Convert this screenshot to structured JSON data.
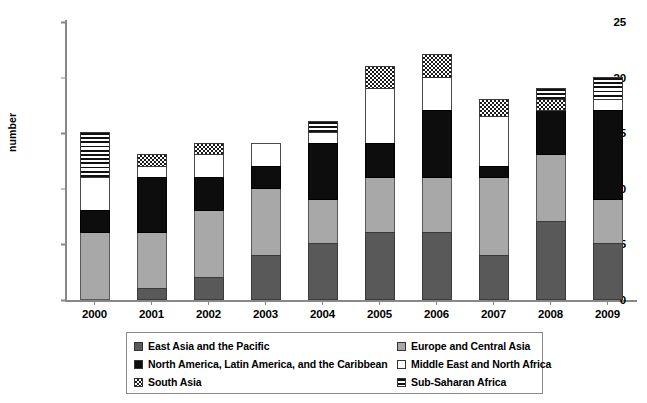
{
  "chart_data": {
    "type": "bar",
    "stacked": true,
    "title": "",
    "xlabel": "",
    "ylabel": "number",
    "ylim": [
      0,
      25
    ],
    "yticks": [
      0,
      5,
      10,
      15,
      20,
      25
    ],
    "grid": false,
    "legend_position": "bottom",
    "categories": [
      "2000",
      "2001",
      "2002",
      "2003",
      "2004",
      "2005",
      "2006",
      "2007",
      "2008",
      "2009"
    ],
    "series": [
      {
        "name": "East Asia and the Pacific",
        "swatch": "dark-gray-solid",
        "color": "#595959",
        "values": [
          0,
          1,
          2,
          4,
          5,
          6,
          6,
          4,
          7,
          5
        ]
      },
      {
        "name": "Europe and Central Asia",
        "swatch": "medium-gray-solid",
        "color": "#a8a8a8",
        "values": [
          6,
          5,
          6,
          6,
          4,
          5,
          5,
          7,
          6,
          4
        ]
      },
      {
        "name": "North America, Latin America, and the Caribbean",
        "swatch": "black-solid",
        "color": "#0d0d0d",
        "values": [
          2,
          5,
          3,
          2,
          5,
          3,
          6,
          1,
          4,
          8
        ]
      },
      {
        "name": "Middle East and North Africa",
        "swatch": "white-solid",
        "color": "#ffffff",
        "values": [
          3,
          1,
          2,
          2,
          1,
          5,
          3,
          4.5,
          0,
          1
        ]
      },
      {
        "name": "South Asia",
        "swatch": "checkerboard",
        "color": "#ffffff",
        "values": [
          0,
          1,
          1,
          0,
          0,
          2,
          2,
          1.5,
          1,
          0
        ]
      },
      {
        "name": "Sub-Saharan Africa",
        "swatch": "horizontal-stripes",
        "color": "#ffffff",
        "values": [
          4,
          0,
          0,
          0,
          1,
          0,
          0,
          0,
          1,
          2
        ]
      }
    ],
    "totals": [
      15,
      13,
      14,
      14,
      16,
      21,
      22,
      18,
      19,
      20
    ]
  },
  "axis": {
    "y_title": "number",
    "y_tick_labels": [
      "0",
      "5",
      "10",
      "15",
      "20",
      "25"
    ],
    "x_tick_labels": [
      "2000",
      "2001",
      "2002",
      "2003",
      "2004",
      "2005",
      "2006",
      "2007",
      "2008",
      "2009"
    ]
  },
  "legend": {
    "left_column": [
      {
        "label": "East Asia and the Pacific",
        "swatch": "east"
      },
      {
        "label": "North America, Latin America, and the Caribbean",
        "swatch": "northamerica"
      },
      {
        "label": "South Asia",
        "swatch": "southasia"
      }
    ],
    "right_column": [
      {
        "label": "Europe and Central Asia",
        "swatch": "europe"
      },
      {
        "label": "Middle East and North Africa",
        "swatch": "middleeast"
      },
      {
        "label": "Sub-Saharan Africa",
        "swatch": "subsaharan"
      }
    ]
  }
}
